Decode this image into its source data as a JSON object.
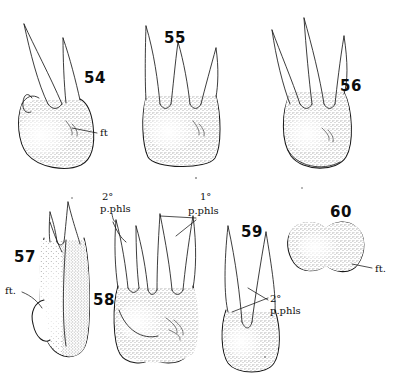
{
  "plate": {
    "title": "",
    "background_color": "#ffffff",
    "ink_color": "#1a1a1a",
    "width": 395,
    "height": 379
  },
  "figures": [
    {
      "number": "54",
      "view": "occlusal-lingual crown view, three cusps",
      "number_x": 84,
      "number_y": 78,
      "labels": [
        {
          "text": "ft",
          "x": 100,
          "y": 133
        }
      ]
    },
    {
      "number": "55",
      "view": "crown view, three cusps",
      "number_x": 164,
      "number_y": 38,
      "labels": []
    },
    {
      "number": "56",
      "view": "crown view, three cusps",
      "number_x": 340,
      "number_y": 86,
      "labels": []
    },
    {
      "number": "57",
      "view": "lateral view, shaded flank",
      "number_x": 16,
      "number_y": 257,
      "labels": [
        {
          "text": "ft.",
          "x": 7,
          "y": 290
        }
      ]
    },
    {
      "number": "58",
      "view": "crown view, four cusps, primary and secondary phalanges marked",
      "number_x": 93,
      "number_y": 300,
      "labels": [
        {
          "text": "2°",
          "x": 104,
          "y": 196
        },
        {
          "text": "p.phls",
          "x": 102,
          "y": 208
        },
        {
          "text": "1°",
          "x": 200,
          "y": 196
        },
        {
          "text": "p.phls",
          "x": 190,
          "y": 210
        }
      ]
    },
    {
      "number": "59",
      "view": "crown view, two cusps",
      "number_x": 241,
      "number_y": 232,
      "labels": [
        {
          "text": "2°",
          "x": 270,
          "y": 298
        },
        {
          "text": "p.phls",
          "x": 272,
          "y": 310
        }
      ]
    },
    {
      "number": "60",
      "view": "occlusal outline, dumbbell shaped",
      "number_x": 330,
      "number_y": 212,
      "labels": [
        {
          "text": "ft.",
          "x": 376,
          "y": 271
        }
      ]
    }
  ],
  "annotations": {
    "ft_abbreviation": "ft",
    "ft_abbreviation_period": "ft.",
    "primary_phalanges": "1° p.phls",
    "secondary_phalanges": "2° p.phls",
    "degree_symbol": "°",
    "phls_text": "p.phls",
    "one_sup": "1°",
    "two_sup": "2°"
  }
}
